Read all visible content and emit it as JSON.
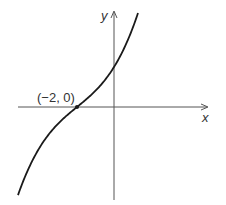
{
  "chart_data": {
    "type": "line",
    "title": "",
    "xlabel": "x",
    "ylabel": "y",
    "function_shape": "y ∝ (x+2)^3 + (x+2)",
    "annotations": [
      {
        "text": "(−2, 0)",
        "x": -2,
        "y": 0
      }
    ],
    "grid": false,
    "legend": null,
    "axes": {
      "x_arrow": true,
      "y_arrow": true,
      "ticks": []
    },
    "colors": {
      "curve": "#1a1a1a",
      "axes": "#555555",
      "text": "#333333"
    }
  },
  "labels": {
    "x_axis": "x",
    "y_axis": "y",
    "point": "(−2, 0)"
  }
}
